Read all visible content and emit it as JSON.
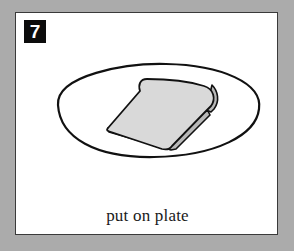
{
  "card": {
    "step_number": "7",
    "caption": "put on plate",
    "illustration": {
      "items": [
        "plate-outline",
        "bread-slice"
      ]
    }
  },
  "colors": {
    "background": "#ababab",
    "card": "#ffffff",
    "badge": "#0c0c0c",
    "bread": "#d9d9d9",
    "bread_crust": "#bdbdbd",
    "outline": "#111111"
  }
}
